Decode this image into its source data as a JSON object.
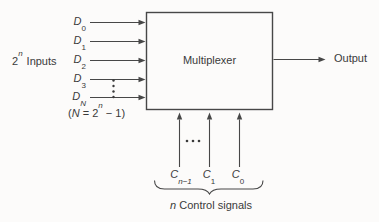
{
  "figure": {
    "background": "#fcfbfa",
    "line_color": "#474747",
    "text_color": "#3a3a3a"
  },
  "mux": {
    "label": "Multiplexer"
  },
  "inputs": {
    "group_label": {
      "base": "2",
      "sup": "n",
      "text": "Inputs"
    },
    "lines": [
      {
        "base": "D",
        "sub": "0"
      },
      {
        "base": "D",
        "sub": "1"
      },
      {
        "base": "D",
        "sub": "2"
      },
      {
        "base": "D",
        "sub": "3"
      },
      {
        "base": "D",
        "sub": "N"
      }
    ],
    "note": {
      "open": "(",
      "var": "N",
      "eq": " = 2",
      "sup": "n",
      "close": " − 1)"
    },
    "ellipsis_icon": "vertical-ellipsis"
  },
  "output": {
    "label": "Output"
  },
  "controls": {
    "labels": [
      {
        "base": "C",
        "sub": "n−1"
      },
      {
        "base": "C",
        "sub": "1"
      },
      {
        "base": "C",
        "sub": "0"
      }
    ],
    "caption": {
      "var": "n",
      "text": " Control signals"
    },
    "ellipsis_icon": "horizontal-ellipsis"
  }
}
